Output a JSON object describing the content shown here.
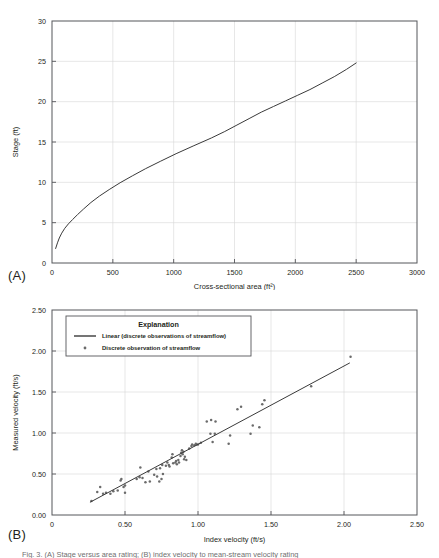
{
  "figure": {
    "panel_a_tag": "(A)",
    "panel_b_tag": "(B)",
    "caption": "Fig. 3. (A) Stage versus area rating; (B) index velocity to mean-stream velocity rating"
  },
  "chart_data": [
    {
      "id": "panel-a",
      "type": "line",
      "title": "",
      "xlabel": "Cross-sectional area (ft²)",
      "ylabel": "Stage (ft)",
      "xlim": [
        0,
        3000
      ],
      "ylim": [
        0,
        30
      ],
      "xticks": [
        0,
        500,
        1000,
        1500,
        2000,
        2500,
        3000
      ],
      "xticklabels": [
        "0",
        "500",
        "1000",
        "1500",
        "2000",
        "2500",
        "3000"
      ],
      "yticks": [
        0,
        5,
        10,
        15,
        20,
        25,
        30
      ],
      "yticklabels": [
        "0",
        "5",
        "10",
        "15",
        "20",
        "25",
        "30"
      ],
      "grid": true,
      "legend": null,
      "series": [
        {
          "name": "Stage-area rating",
          "color": "#3a3a3a",
          "x": [
            30,
            45,
            60,
            80,
            105,
            135,
            170,
            210,
            260,
            320,
            390,
            470,
            560,
            660,
            770,
            890,
            1020,
            1160,
            1310,
            1420,
            1520,
            1620,
            1720,
            1820,
            1920,
            2020,
            2120,
            2220,
            2320,
            2420,
            2500
          ],
          "y": [
            1.8,
            2.5,
            3.1,
            3.7,
            4.3,
            4.85,
            5.4,
            6.0,
            6.7,
            7.5,
            8.3,
            9.1,
            9.95,
            10.8,
            11.7,
            12.6,
            13.55,
            14.5,
            15.5,
            16.3,
            17.1,
            17.9,
            18.7,
            19.4,
            20.1,
            20.8,
            21.5,
            22.3,
            23.1,
            24.0,
            24.8
          ]
        }
      ]
    },
    {
      "id": "panel-b",
      "type": "scatter",
      "title": "",
      "xlabel": "Index velocity (ft/s)",
      "ylabel": "Measured velocity (ft/s)",
      "xlim": [
        0,
        2.5
      ],
      "ylim": [
        0,
        2.5
      ],
      "xticks": [
        0,
        0.5,
        1.0,
        1.5,
        2.0,
        2.5
      ],
      "xticklabels": [
        "0",
        "0.50",
        "1.00",
        "1.50",
        "2.00",
        "2.50"
      ],
      "yticks": [
        0,
        0.5,
        1.0,
        1.5,
        2.0,
        2.5
      ],
      "yticklabels": [
        "0.00",
        "0.50",
        "1.00",
        "1.50",
        "2.00",
        "2.50"
      ],
      "grid": true,
      "legend": {
        "title": "Explanation",
        "position": "upper-left-inside",
        "entries": [
          {
            "label": "Linear (discrete observations of streamflow)",
            "marker": "line",
            "color": "#3a3a3a"
          },
          {
            "label": "Discrete observation of streamflow",
            "marker": "point",
            "color": "#6b6b6b"
          }
        ]
      },
      "series": [
        {
          "name": "Linear (discrete observations of streamflow)",
          "type": "line",
          "color": "#3a3a3a",
          "x": [
            0.26,
            2.04
          ],
          "y": [
            0.155,
            1.855
          ]
        },
        {
          "name": "Discrete observation of streamflow",
          "type": "scatter",
          "color": "#6b6b6b",
          "points": [
            [
              0.27,
              0.17
            ],
            [
              0.31,
              0.28
            ],
            [
              0.33,
              0.34
            ],
            [
              0.35,
              0.26
            ],
            [
              0.37,
              0.27
            ],
            [
              0.4,
              0.26
            ],
            [
              0.42,
              0.29
            ],
            [
              0.45,
              0.3
            ],
            [
              0.47,
              0.42
            ],
            [
              0.475,
              0.44
            ],
            [
              0.49,
              0.34
            ],
            [
              0.5,
              0.36
            ],
            [
              0.5,
              0.27
            ],
            [
              0.58,
              0.44
            ],
            [
              0.6,
              0.46
            ],
            [
              0.605,
              0.58
            ],
            [
              0.62,
              0.45
            ],
            [
              0.64,
              0.4
            ],
            [
              0.66,
              0.53
            ],
            [
              0.67,
              0.41
            ],
            [
              0.7,
              0.49
            ],
            [
              0.715,
              0.56
            ],
            [
              0.72,
              0.47
            ],
            [
              0.735,
              0.41
            ],
            [
              0.74,
              0.57
            ],
            [
              0.75,
              0.44
            ],
            [
              0.755,
              0.61
            ],
            [
              0.76,
              0.5
            ],
            [
              0.78,
              0.6
            ],
            [
              0.79,
              0.64
            ],
            [
              0.8,
              0.61
            ],
            [
              0.805,
              0.59
            ],
            [
              0.82,
              0.7
            ],
            [
              0.825,
              0.74
            ],
            [
              0.83,
              0.63
            ],
            [
              0.845,
              0.64
            ],
            [
              0.85,
              0.66
            ],
            [
              0.855,
              0.62
            ],
            [
              0.865,
              0.67
            ],
            [
              0.87,
              0.64
            ],
            [
              0.88,
              0.72
            ],
            [
              0.885,
              0.76
            ],
            [
              0.89,
              0.79
            ],
            [
              0.895,
              0.74
            ],
            [
              0.9,
              0.77
            ],
            [
              0.905,
              0.68
            ],
            [
              0.91,
              0.71
            ],
            [
              0.92,
              0.67
            ],
            [
              0.94,
              0.81
            ],
            [
              0.955,
              0.84
            ],
            [
              0.96,
              0.86
            ],
            [
              0.975,
              0.85
            ],
            [
              0.985,
              0.87
            ],
            [
              0.99,
              0.86
            ],
            [
              1.0,
              0.86
            ],
            [
              1.02,
              0.88
            ],
            [
              1.06,
              1.14
            ],
            [
              1.085,
              0.99
            ],
            [
              1.09,
              1.16
            ],
            [
              1.1,
              0.89
            ],
            [
              1.115,
              0.99
            ],
            [
              1.12,
              1.14
            ],
            [
              1.21,
              0.87
            ],
            [
              1.22,
              0.97
            ],
            [
              1.27,
              1.29
            ],
            [
              1.295,
              1.32
            ],
            [
              1.36,
              0.99
            ],
            [
              1.375,
              1.09
            ],
            [
              1.42,
              1.07
            ],
            [
              1.44,
              1.35
            ],
            [
              1.455,
              1.4
            ],
            [
              1.775,
              1.57
            ],
            [
              2.045,
              1.93
            ]
          ]
        }
      ]
    }
  ]
}
